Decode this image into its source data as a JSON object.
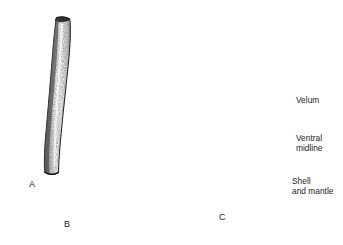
{
  "figure": {
    "background_color": "#ffffff",
    "ink_color": "#1d1d1d",
    "panels": [
      {
        "id": "A",
        "letter": "A",
        "subject": "tusk-shell-broad",
        "description": "Broad tapering tusk shell, stippled shading"
      },
      {
        "id": "B",
        "letter": "B",
        "subject": "tusk-shell-slender-curved",
        "description": "Long slender curved tusk shell"
      },
      {
        "id": "C",
        "letter": "C",
        "subject": "scaphopod-larva",
        "description": "Veliger larva with ciliated velum, bilobed shell and mantle"
      }
    ],
    "callouts": [
      {
        "id": "velum",
        "text": "Velum",
        "leader": "horizontal"
      },
      {
        "id": "ventral",
        "text": "Ventral\nmidline",
        "leader": "horizontal"
      },
      {
        "id": "shell",
        "text": "Shell\nand mantle",
        "leader": "angled"
      }
    ]
  }
}
